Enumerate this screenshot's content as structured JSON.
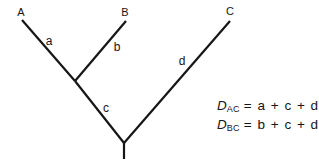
{
  "figure": {
    "colors": {
      "paper": "#ffffff",
      "ink": "#161616"
    },
    "taxa": [
      {
        "label": "A"
      },
      {
        "label": "B"
      },
      {
        "label": "C"
      }
    ],
    "branches": [
      {
        "label": "a"
      },
      {
        "label": "b"
      },
      {
        "label": "c"
      },
      {
        "label": "d"
      }
    ],
    "equations": [
      {
        "lhs_var": "D",
        "lhs_sub": "AC",
        "rhs": "= a + c + d"
      },
      {
        "lhs_var": "D",
        "lhs_sub": "BC",
        "rhs": "= b + c + d"
      }
    ]
  }
}
